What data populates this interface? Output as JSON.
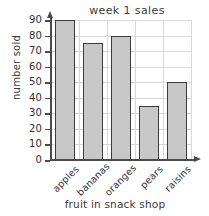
{
  "chart_data": {
    "type": "bar",
    "title": "week 1 sales",
    "title_display": "week  1  sales",
    "xlabel": "fruit in snack shop",
    "ylabel": "number sold",
    "categories": [
      "apples",
      "bananas",
      "oranges",
      "pears",
      "raisins"
    ],
    "values": [
      90,
      75,
      80,
      35,
      50
    ],
    "ylim": [
      0,
      90
    ],
    "ytick_step": 10,
    "yticks": [
      0,
      10,
      20,
      30,
      40,
      50,
      60,
      70,
      80,
      90
    ],
    "ytick_labels": [
      "0",
      "10",
      "20",
      "30",
      "40",
      "50",
      "60",
      "70",
      "80",
      "90"
    ],
    "grid": true,
    "grid_axes": "both",
    "legend": false,
    "legend_position": "none",
    "bar_fill_color": "#c8c8c8",
    "bar_edge_color": "#3c3c3c",
    "grid_color": "#d8d8d8",
    "axis_color": "#4a4a4a",
    "text_color": "#3a3a3a",
    "background_color": "#ffffff",
    "x_label_rotation": -45
  }
}
